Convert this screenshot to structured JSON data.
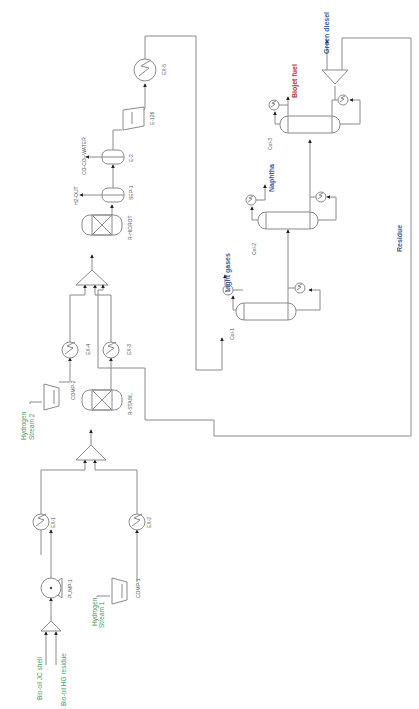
{
  "diagram": {
    "orientation": "rotated-90-ccw",
    "colors": {
      "line": "#8a8a8a",
      "feed_label": "#4a9a5a",
      "product_label": "#3a5a9a",
      "biojet_label": "#b03030",
      "equipment_label": "#555555"
    },
    "feeds": {
      "bio_oil_jc_shell": "Bio-oil JC shell",
      "bio_oil_hg_residue": "Bio-oil HG residue",
      "hydrogen_stream_1": [
        "Hydrogen",
        "Stream 1"
      ],
      "hydrogen_stream_2": [
        "Hydrogen",
        "Stream 2"
      ]
    },
    "equipment": {
      "pump_1": "PUMP-1",
      "comp_1": "COMP-1",
      "comp_2": "COMP-2",
      "ex_1": "EX-1",
      "ex_2": "EX-2",
      "ex_3": "EX-3",
      "ex_4": "EX-4",
      "ex_5": "EX-5",
      "r_stabil": "R-STABIL",
      "r_hidrot": "R-HIDROT",
      "sep_1": "SEP-1",
      "e_2": "E-2",
      "e_126": "E-126",
      "col_1": "Col-1",
      "col_2": "Col-2",
      "col_3": "Col-3"
    },
    "outlets": {
      "h2_out": "H2-OUT",
      "co_co2_water": "CO-CO₂-WATER"
    },
    "products": {
      "light_gases": "Light gases",
      "naphtha": "Naphtha",
      "biojet_fuel": "Biojet fuel",
      "green_diesel": "Green diesel",
      "residue": "Residue"
    }
  }
}
